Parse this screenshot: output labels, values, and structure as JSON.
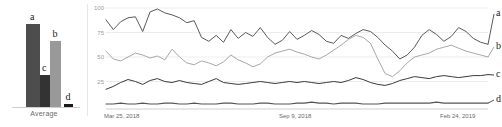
{
  "bar_panel": {
    "axis_label": "Average",
    "bars": [
      {
        "key": "a",
        "label": "a",
        "value": 97,
        "color": "#4d4d4d"
      },
      {
        "key": "c",
        "label": "c",
        "value": 37,
        "color": "#333333"
      },
      {
        "key": "b",
        "label": "b",
        "value": 77,
        "color": "#999999"
      },
      {
        "key": "d",
        "label": "d",
        "value": 3,
        "color": "#1a1a1a"
      }
    ]
  },
  "line_panel": {
    "y_ticks": [
      "100",
      "75",
      "50",
      "25"
    ],
    "x_ticks": [
      "Mar 25, 2018",
      "Sep 9, 2018",
      "Feb 24, 2019"
    ],
    "series_labels": [
      "a",
      "b",
      "c",
      "d"
    ]
  },
  "chart_data": [
    {
      "type": "bar",
      "title": "Average",
      "categories": [
        "a",
        "c",
        "b",
        "d"
      ],
      "values": [
        97,
        37,
        77,
        3
      ],
      "xlabel": "Average",
      "ylabel": "",
      "ylim": [
        0,
        100
      ],
      "grid": false,
      "legend": "none",
      "colors": [
        "#4d4d4d",
        "#333333",
        "#999999",
        "#1a1a1a"
      ]
    },
    {
      "type": "line",
      "title": "",
      "xlabel": "",
      "ylabel": "",
      "ylim": [
        0,
        100
      ],
      "grid": true,
      "legend": "right-inline",
      "x_tick_labels": [
        "Mar 25, 2018",
        "Sep 9, 2018",
        "Feb 24, 2019"
      ],
      "y_tick_labels": [
        "100",
        "75",
        "50",
        "25"
      ],
      "series": [
        {
          "name": "a",
          "color": "#595959",
          "values": [
            88,
            78,
            86,
            90,
            91,
            76,
            96,
            99,
            95,
            93,
            90,
            85,
            87,
            70,
            66,
            72,
            65,
            78,
            69,
            75,
            71,
            80,
            70,
            63,
            67,
            76,
            68,
            72,
            77,
            73,
            66,
            64,
            72,
            69,
            74,
            78,
            76,
            70,
            62,
            56,
            48,
            52,
            60,
            72,
            78,
            73,
            66,
            71,
            80,
            76,
            69,
            65,
            63
          ]
        },
        {
          "name": "b",
          "color": "#a8a8a8",
          "values": [
            56,
            48,
            46,
            50,
            54,
            52,
            49,
            51,
            47,
            58,
            50,
            44,
            42,
            46,
            44,
            41,
            45,
            52,
            47,
            44,
            40,
            43,
            50,
            54,
            56,
            58,
            55,
            53,
            50,
            48,
            52,
            57,
            62,
            68,
            72,
            70,
            64,
            48,
            33,
            30,
            36,
            44,
            50,
            52,
            54,
            58,
            60,
            62,
            59,
            56,
            54,
            52,
            50
          ]
        },
        {
          "name": "c",
          "color": "#3a3a3a",
          "values": [
            17,
            20,
            24,
            27,
            25,
            22,
            26,
            28,
            25,
            24,
            26,
            24,
            23,
            22,
            25,
            28,
            24,
            23,
            22,
            23,
            24,
            25,
            24,
            23,
            24,
            25,
            24,
            25,
            24,
            23,
            24,
            25,
            24,
            26,
            29,
            27,
            24,
            22,
            21,
            23,
            26,
            28,
            30,
            29,
            28,
            30,
            31,
            30,
            29,
            30,
            31,
            31,
            32
          ]
        },
        {
          "name": "d",
          "color": "#555555",
          "values": [
            2,
            2,
            3,
            2,
            2,
            3,
            2,
            2,
            3,
            3,
            2,
            2,
            3,
            2,
            2,
            2,
            3,
            3,
            2,
            2,
            2,
            3,
            3,
            2,
            2,
            2,
            3,
            3,
            4,
            3,
            3,
            2,
            3,
            3,
            3,
            2,
            2,
            2,
            3,
            3,
            3,
            3,
            3,
            3,
            3,
            4,
            3,
            3,
            3,
            3,
            3,
            3,
            3
          ]
        }
      ]
    }
  ]
}
